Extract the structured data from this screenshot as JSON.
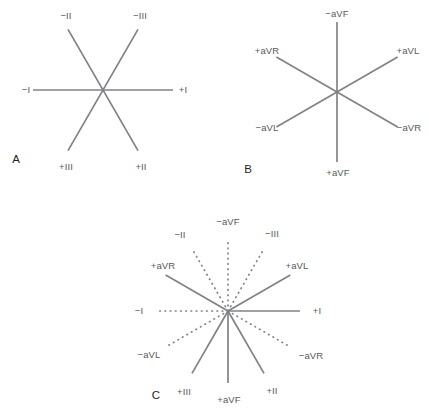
{
  "figure": {
    "width": 429,
    "height": 410,
    "background": "#ffffff",
    "line_color": "#808285",
    "label_color": "#58595b",
    "panel_letter_color": "#231f20"
  },
  "panels": [
    {
      "id": "A",
      "letter": "A",
      "letter_pos": {
        "x": 16,
        "y": 160
      },
      "center": {
        "x": 103,
        "y": 90
      },
      "radius": 70,
      "description": "Standard bipolar limb leads I, II and III shown as three intersecting axes",
      "axes": [
        {
          "name": "lead-I",
          "angle_deg": 0,
          "style": "solid",
          "positive_label": "+I",
          "negative_label": "−I"
        },
        {
          "name": "lead-II",
          "angle_deg": 60,
          "style": "solid",
          "positive_label": "+II",
          "negative_label": "−II"
        },
        {
          "name": "lead-III",
          "angle_deg": 120,
          "style": "solid",
          "positive_label": "+III",
          "negative_label": "−III"
        }
      ],
      "labels": [
        {
          "text": "−II",
          "x": 66,
          "y": 16,
          "anchor": "anchor-mid"
        },
        {
          "text": "−III",
          "x": 140,
          "y": 16,
          "anchor": "anchor-mid"
        },
        {
          "text": "−I",
          "x": 26,
          "y": 90,
          "anchor": "anchor-mid"
        },
        {
          "text": "+I",
          "x": 183,
          "y": 90,
          "anchor": "anchor-mid"
        },
        {
          "text": "+III",
          "x": 66,
          "y": 167,
          "anchor": "anchor-mid"
        },
        {
          "text": "+II",
          "x": 141,
          "y": 167,
          "anchor": "anchor-mid"
        }
      ]
    },
    {
      "id": "B",
      "letter": "B",
      "letter_pos": {
        "x": 248,
        "y": 170
      },
      "center": {
        "x": 337,
        "y": 92
      },
      "radius": 70,
      "description": "Augmented unipolar limb leads aVR, aVL and aVF shown as three intersecting axes",
      "axes": [
        {
          "name": "lead-aVL",
          "angle_deg": 30,
          "style": "solid",
          "positive_label": "+aVL",
          "negative_label": "−aVL"
        },
        {
          "name": "lead-aVR",
          "angle_deg": 150,
          "style": "solid",
          "positive_label": "+aVR",
          "negative_label": "−aVR"
        },
        {
          "name": "lead-aVF",
          "angle_deg": 270,
          "style": "solid",
          "positive_label": "+aVF",
          "negative_label": "−aVF"
        }
      ],
      "labels": [
        {
          "text": "−aVF",
          "x": 337,
          "y": 14,
          "anchor": "anchor-mid"
        },
        {
          "text": "+aVR",
          "x": 267,
          "y": 51,
          "anchor": "anchor-mid"
        },
        {
          "text": "+aVL",
          "x": 408,
          "y": 51,
          "anchor": "anchor-mid"
        },
        {
          "text": "−aVL",
          "x": 267,
          "y": 128,
          "anchor": "anchor-mid"
        },
        {
          "text": "−aVR",
          "x": 409,
          "y": 128,
          "anchor": "anchor-mid"
        },
        {
          "text": "+aVF",
          "x": 338,
          "y": 173,
          "anchor": "anchor-mid"
        }
      ]
    },
    {
      "id": "C",
      "letter": "C",
      "letter_pos": {
        "x": 156,
        "y": 396
      },
      "center": {
        "x": 228,
        "y": 311
      },
      "radius": 72,
      "description": "Complete hexaxial reference system: solid rays are positive lead directions, dotted rays are negative lead directions",
      "axes": [
        {
          "name": "lead-I-positive",
          "angle_deg": 0,
          "style": "solid",
          "label": "+I"
        },
        {
          "name": "lead-aVL-positive",
          "angle_deg": 30,
          "style": "solid",
          "label": "+aVL"
        },
        {
          "name": "lead-III-negative",
          "angle_deg": 60,
          "style": "dotted",
          "label": "−III"
        },
        {
          "name": "lead-aVF-negative",
          "angle_deg": 90,
          "style": "dotted",
          "label": "−aVF"
        },
        {
          "name": "lead-II-negative",
          "angle_deg": 120,
          "style": "dotted",
          "label": "−II"
        },
        {
          "name": "lead-aVR-positive",
          "angle_deg": 150,
          "style": "solid",
          "label": "+aVR"
        },
        {
          "name": "lead-I-negative",
          "angle_deg": 180,
          "style": "dotted",
          "label": "−I"
        },
        {
          "name": "lead-aVL-negative",
          "angle_deg": 210,
          "style": "dotted",
          "label": "−aVL"
        },
        {
          "name": "lead-III-positive",
          "angle_deg": 240,
          "style": "solid",
          "label": "+III"
        },
        {
          "name": "lead-aVF-positive",
          "angle_deg": 270,
          "style": "solid",
          "label": "+aVF"
        },
        {
          "name": "lead-II-positive",
          "angle_deg": 300,
          "style": "solid",
          "label": "+II"
        },
        {
          "name": "lead-aVR-negative",
          "angle_deg": 330,
          "style": "dotted",
          "label": "−aVR"
        }
      ],
      "labels": [
        {
          "text": "−aVF",
          "x": 228,
          "y": 222,
          "anchor": "anchor-mid"
        },
        {
          "text": "−II",
          "x": 180,
          "y": 235,
          "anchor": "anchor-mid"
        },
        {
          "text": "−III",
          "x": 272,
          "y": 234,
          "anchor": "anchor-mid"
        },
        {
          "text": "+aVR",
          "x": 163,
          "y": 266,
          "anchor": "anchor-mid"
        },
        {
          "text": "+aVL",
          "x": 297,
          "y": 266,
          "anchor": "anchor-mid"
        },
        {
          "text": "−I",
          "x": 139,
          "y": 311,
          "anchor": "anchor-mid"
        },
        {
          "text": "+I",
          "x": 317,
          "y": 311,
          "anchor": "anchor-mid"
        },
        {
          "text": "−aVL",
          "x": 149,
          "y": 355,
          "anchor": "anchor-mid"
        },
        {
          "text": "−aVR",
          "x": 311,
          "y": 356,
          "anchor": "anchor-mid"
        },
        {
          "text": "+III",
          "x": 184,
          "y": 392,
          "anchor": "anchor-mid"
        },
        {
          "text": "+aVF",
          "x": 229,
          "y": 400,
          "anchor": "anchor-mid"
        },
        {
          "text": "+II",
          "x": 272,
          "y": 391,
          "anchor": "anchor-mid"
        }
      ]
    }
  ],
  "chart_data": {
    "type": "diagram",
    "panel_a": {
      "leads": [
        "I",
        "II",
        "III"
      ],
      "angles_positive_deg": [
        0,
        60,
        120
      ]
    },
    "panel_b": {
      "leads": [
        "aVL",
        "aVR",
        "aVF"
      ],
      "angles_positive_deg": [
        30,
        150,
        270
      ]
    },
    "panel_c": {
      "rays_deg": [
        0,
        30,
        60,
        90,
        120,
        150,
        180,
        210,
        240,
        270,
        300,
        330
      ],
      "solid_rays": [
        "+I",
        "+aVL",
        "+aVR",
        "+III",
        "+aVF",
        "+II"
      ],
      "dotted_rays": [
        "−III",
        "−aVF",
        "−II",
        "−I",
        "−aVL",
        "−aVR"
      ]
    }
  }
}
